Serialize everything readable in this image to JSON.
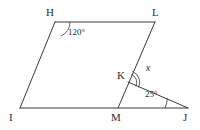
{
  "figure": {
    "type": "geometry-diagram",
    "background_color": "#ffffff",
    "line_color": "#3a3a3a",
    "text_color": "#2b2b2b",
    "vertices": [
      {
        "id": "H",
        "label": "H",
        "x": 55,
        "y": 22,
        "label_x": 46,
        "label_y": 7
      },
      {
        "id": "L",
        "label": "L",
        "x": 155,
        "y": 22,
        "label_x": 152,
        "label_y": 7
      },
      {
        "id": "I",
        "label": "I",
        "x": 20,
        "y": 108,
        "label_x": 9,
        "label_y": 112
      },
      {
        "id": "M",
        "label": "M",
        "x": 118,
        "y": 108,
        "label_x": 111,
        "label_y": 112
      },
      {
        "id": "J",
        "label": "J",
        "x": 188,
        "y": 108,
        "label_x": 183,
        "label_y": 112
      },
      {
        "id": "K",
        "label": "K",
        "x": 128,
        "y": 82,
        "label_x": 117,
        "label_y": 70
      }
    ],
    "segments": [
      {
        "from": "H",
        "to": "L"
      },
      {
        "from": "H",
        "to": "I"
      },
      {
        "from": "I",
        "to": "J"
      },
      {
        "from": "L",
        "to": "M"
      },
      {
        "from": "K",
        "to": "J"
      }
    ],
    "angles": [
      {
        "id": "angle-H",
        "vertex": "H",
        "label": "120°",
        "label_x": 68,
        "label_y": 28,
        "arcs": 1
      },
      {
        "id": "angle-K",
        "vertex": "K",
        "label": "x",
        "label_x": 146,
        "label_y": 64,
        "arcs": 2,
        "italic": true
      },
      {
        "id": "angle-J",
        "vertex": "J",
        "label": "25°",
        "label_x": 145,
        "label_y": 90,
        "arcs": 1
      }
    ]
  }
}
